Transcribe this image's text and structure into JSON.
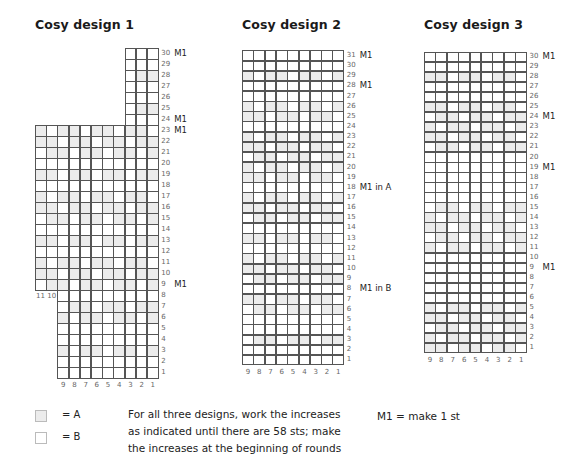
{
  "titles": [
    "Cosy design 1",
    "Cosy design 2",
    "Cosy design 3"
  ],
  "designs": [
    {
      "name": "Cosy design 1",
      "origin": {
        "x": 35,
        "bottom": 378
      },
      "cell_w": 11.2,
      "cell_h": 11,
      "segments": [
        {
          "rows": [
            1,
            8
          ],
          "cols": 9,
          "col_offset": 2
        },
        {
          "rows": [
            9,
            23
          ],
          "cols": 11,
          "col_offset": 0
        },
        {
          "rows": [
            24,
            30
          ],
          "cols": 3,
          "col_offset": 8
        }
      ],
      "row_labels": [
        "1",
        "2",
        "3",
        "4",
        "5",
        "6",
        "7",
        "8",
        "9",
        "10",
        "11",
        "12",
        "13",
        "14",
        "15",
        "16",
        "17",
        "18",
        "19",
        "20",
        "21",
        "22",
        "23",
        "24",
        "25",
        "26",
        "27",
        "28",
        "29",
        "30"
      ],
      "col_labels_bottom": [
        "9",
        "8",
        "7",
        "6",
        "5",
        "4",
        "3",
        "2",
        "1"
      ],
      "col_labels_side": [
        "11",
        "10"
      ],
      "notes": [
        {
          "row": 30,
          "text": "M1"
        },
        {
          "row": 24,
          "text": "M1"
        },
        {
          "row": 23,
          "text": "M1"
        },
        {
          "row": 9,
          "text": "M1"
        }
      ],
      "shaded_rows": [
        3,
        6,
        7,
        9,
        10,
        11,
        13,
        15,
        16,
        17,
        19,
        21,
        22,
        23,
        25,
        28
      ]
    },
    {
      "name": "Cosy design 2",
      "origin": {
        "x": 242,
        "bottom": 365
      },
      "cell_w": 11.3,
      "cell_h": 10.15,
      "segments": [
        {
          "rows": [
            1,
            31
          ],
          "cols": 9,
          "col_offset": 0
        }
      ],
      "row_labels": [
        "1",
        "2",
        "3",
        "4",
        "5",
        "6",
        "7",
        "8",
        "9",
        "10",
        "11",
        "12",
        "13",
        "14",
        "15",
        "16",
        "17",
        "18",
        "19",
        "20",
        "21",
        "22",
        "23",
        "24",
        "25",
        "26",
        "27",
        "28",
        "29",
        "30",
        "31"
      ],
      "col_labels_bottom": [
        "9",
        "8",
        "7",
        "6",
        "5",
        "4",
        "3",
        "2",
        "1"
      ],
      "notes": [
        {
          "row": 31,
          "text": "M1"
        },
        {
          "row": 28,
          "text": "M1"
        },
        {
          "row": 18,
          "text": "M1 in A"
        },
        {
          "row": 8,
          "text": "M1 in B"
        }
      ],
      "shaded_rows": [
        3,
        6,
        7,
        9,
        10,
        11,
        13,
        15,
        16,
        17,
        19,
        20,
        21,
        22,
        23,
        25,
        26,
        29
      ]
    },
    {
      "name": "Cosy design 3",
      "origin": {
        "x": 424,
        "bottom": 353
      },
      "cell_w": 11.4,
      "cell_h": 10.05,
      "segments": [
        {
          "rows": [
            1,
            30
          ],
          "cols": 9,
          "col_offset": 0
        }
      ],
      "row_labels": [
        "1",
        "2",
        "3",
        "4",
        "5",
        "6",
        "7",
        "8",
        "9",
        "10",
        "11",
        "12",
        "13",
        "14",
        "15",
        "16",
        "17",
        "18",
        "19",
        "20",
        "21",
        "22",
        "23",
        "24",
        "25",
        "26",
        "27",
        "28",
        "29",
        "30"
      ],
      "col_labels_bottom": [
        "9",
        "8",
        "7",
        "6",
        "5",
        "4",
        "3",
        "2",
        "1"
      ],
      "notes": [
        {
          "row": 30,
          "text": "M1"
        },
        {
          "row": 24,
          "text": "M1"
        },
        {
          "row": 19,
          "text": "M1"
        },
        {
          "row": 9,
          "text": "M1"
        }
      ],
      "shaded_rows": [
        1,
        2,
        3,
        4,
        5,
        11,
        12,
        13,
        14,
        15,
        21,
        22,
        23,
        24,
        25,
        28
      ]
    }
  ],
  "legend": {
    "a_label": "= A",
    "b_label": "= B",
    "a_color": "#ececec",
    "b_color": "#ffffff"
  },
  "instructions": {
    "line1": "For all three designs, work the increases",
    "line2": "as indicated until there are 58 sts; make",
    "line3": "the increases at the beginning of rounds"
  },
  "m1_definition": "M1 = make 1 st"
}
